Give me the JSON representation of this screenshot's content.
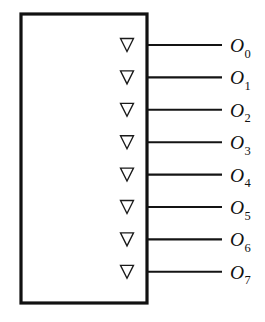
{
  "figure": {
    "name": "decoder-output-block",
    "background_color": "#ffffff",
    "line_color": "#111111",
    "box": {
      "x": 21,
      "y": 14,
      "width": 126,
      "height": 289,
      "border_width": 3.2,
      "fill": "#ffffff"
    },
    "wire": {
      "start_x": 147,
      "end_x": 222,
      "stroke_width": 2.1
    },
    "bubble": {
      "shape": "inverted-triangle",
      "width": 13,
      "height": 13,
      "center_x": 127,
      "fill": "#ffffff",
      "stroke": "#1a1a1a"
    },
    "label_x": 230,
    "first_row_y": 45,
    "row_spacing": 32.4
  },
  "outputs": [
    {
      "base": "O",
      "subscript": "0",
      "full": "O0",
      "y": 45
    },
    {
      "base": "O",
      "subscript": "1",
      "full": "O1",
      "y": 77.4
    },
    {
      "base": "O",
      "subscript": "2",
      "full": "O2",
      "y": 109.8
    },
    {
      "base": "O",
      "subscript": "3",
      "full": "O3",
      "y": 142.2
    },
    {
      "base": "O",
      "subscript": "4",
      "full": "O4",
      "y": 174.6
    },
    {
      "base": "O",
      "subscript": "5",
      "full": "O5",
      "y": 207.0
    },
    {
      "base": "O",
      "subscript": "6",
      "full": "O6",
      "y": 239.4
    },
    {
      "base": "O",
      "subscript": "7",
      "full": "O7",
      "y": 271.8
    }
  ]
}
